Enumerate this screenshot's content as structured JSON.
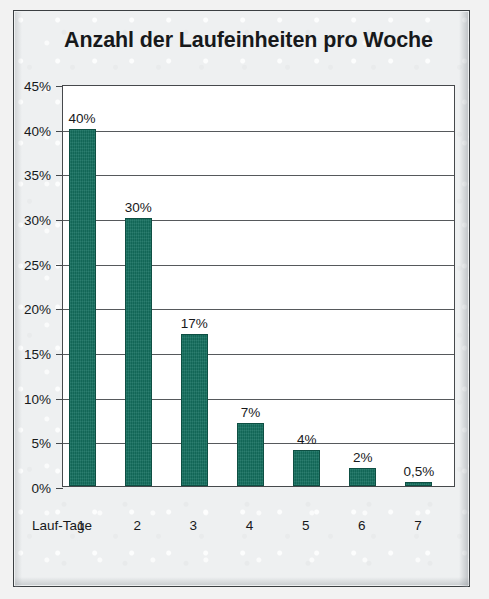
{
  "chart_data": {
    "type": "bar",
    "title": "Anzahl der Laufeinheiten pro Woche",
    "xlabel": "Lauf-Tage",
    "ylabel": "",
    "categories": [
      "1",
      "2",
      "3",
      "4",
      "5",
      "6",
      "7"
    ],
    "values": [
      40,
      30,
      17,
      7,
      4,
      2,
      0.5
    ],
    "point_labels": [
      "40%",
      "30%",
      "17%",
      "7%",
      "4%",
      "2%",
      "0,5%"
    ],
    "ylim": [
      0,
      45
    ],
    "ytick_values": [
      0,
      5,
      10,
      15,
      20,
      25,
      30,
      35,
      40,
      45
    ],
    "ytick_labels": [
      "0%",
      "5%",
      "10%",
      "15%",
      "20%",
      "25%",
      "30%",
      "35%",
      "40%",
      "45%"
    ],
    "grid": true,
    "legend": false,
    "series": [
      {
        "name": "Anteil",
        "values": [
          40,
          30,
          17,
          7,
          4,
          2,
          0.5
        ]
      }
    ],
    "colors": {
      "bar_fill": "#14705f",
      "bar_border": "#0e4f43",
      "gridline": "#56595c",
      "axis": "#46494c",
      "plot_background": "#ffffff",
      "page_background": "#eef0f1",
      "text": "#17191b"
    }
  }
}
